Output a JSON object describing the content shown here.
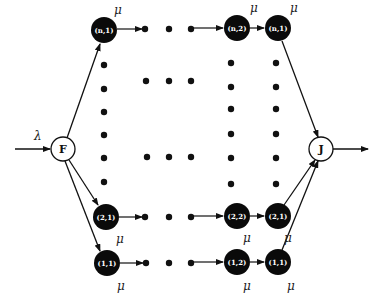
{
  "diagram": {
    "type": "queueing-network",
    "input_rate_label": "λ",
    "service_rate_label": "μ",
    "fork_node": {
      "label": "F",
      "x": 63,
      "y": 149
    },
    "join_node": {
      "label": "J",
      "x": 321,
      "y": 149
    },
    "queues": [
      {
        "id": "n1_left",
        "label": "(n,1)",
        "x": 104,
        "y": 30,
        "mu_x": 114,
        "mu_y": 14
      },
      {
        "id": "n2",
        "label": "(n,2)",
        "x": 237,
        "y": 28,
        "mu_x": 250,
        "mu_y": 12
      },
      {
        "id": "n1_right",
        "label": "(n,1)",
        "x": 278,
        "y": 28,
        "mu_x": 290,
        "mu_y": 12
      },
      {
        "id": "21_left",
        "label": "(2,1)",
        "x": 106,
        "y": 217,
        "mu_x": 116,
        "mu_y": 243
      },
      {
        "id": "22",
        "label": "(2,2)",
        "x": 237,
        "y": 216,
        "mu_x": 243,
        "mu_y": 242
      },
      {
        "id": "21_right",
        "label": "(2,1)",
        "x": 278,
        "y": 216,
        "mu_x": 284,
        "mu_y": 242
      },
      {
        "id": "11_left",
        "label": "(1,1)",
        "x": 107,
        "y": 263,
        "mu_x": 117,
        "mu_y": 290
      },
      {
        "id": "12",
        "label": "(1,2)",
        "x": 237,
        "y": 262,
        "mu_x": 243,
        "mu_y": 290
      },
      {
        "id": "11_right",
        "label": "(1,1)",
        "x": 278,
        "y": 262,
        "mu_x": 287,
        "mu_y": 290
      }
    ],
    "ellipsis_dots": [
      [
        145,
        29
      ],
      [
        169,
        29
      ],
      [
        191,
        29
      ],
      [
        145,
        217
      ],
      [
        169,
        217
      ],
      [
        191,
        217
      ],
      [
        146,
        263
      ],
      [
        169,
        263
      ],
      [
        191,
        263
      ],
      [
        146,
        81
      ],
      [
        169,
        81
      ],
      [
        191,
        81
      ],
      [
        147,
        157
      ],
      [
        169,
        157
      ],
      [
        191,
        157
      ],
      [
        104,
        65
      ],
      [
        104,
        89
      ],
      [
        104,
        112
      ],
      [
        104,
        135
      ],
      [
        104,
        158
      ],
      [
        104,
        182
      ],
      [
        231,
        63
      ],
      [
        231,
        87
      ],
      [
        231,
        109
      ],
      [
        231,
        134
      ],
      [
        231,
        158
      ],
      [
        231,
        184
      ],
      [
        276,
        63
      ],
      [
        276,
        87
      ],
      [
        276,
        109
      ],
      [
        276,
        134
      ],
      [
        276,
        158
      ],
      [
        276,
        184
      ]
    ]
  }
}
